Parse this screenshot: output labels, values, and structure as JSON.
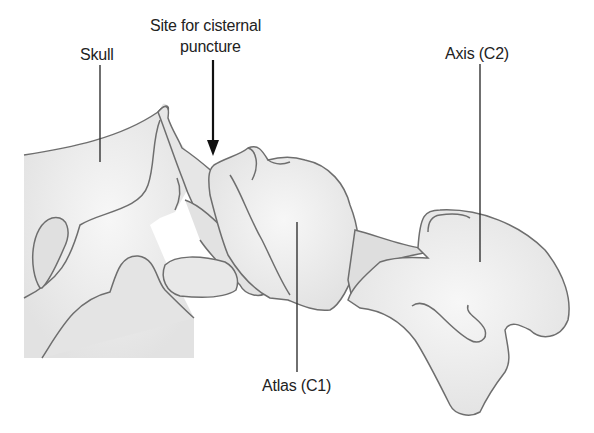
{
  "diagram": {
    "type": "anatomical-illustration",
    "colors": {
      "bone_fill": "#ececec",
      "bone_shade": "#dcdcdc",
      "outline": "#6e6e6e",
      "leader_line": "#333333",
      "arrow": "#111111",
      "text": "#222222"
    },
    "labels": {
      "skull": "Skull",
      "puncture_line1": "Site for cisternal",
      "puncture_line2": "puncture",
      "axis": "Axis (C2)",
      "atlas": "Atlas (C1)"
    }
  }
}
